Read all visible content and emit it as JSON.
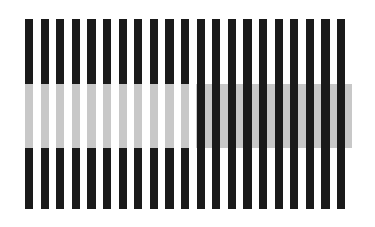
{
  "figure": {
    "canvas": {
      "width": 375,
      "height": 227,
      "background": "#ffffff"
    },
    "plate": {
      "x": 25,
      "y": 19,
      "width": 327,
      "height": 190
    },
    "colors": {
      "stripe_dark": "#1a1a1a",
      "stripe_light": "#ffffff",
      "band_gray": "#c8c8c8",
      "band_gray_left_label": "gray on dark stripes (appears lighter)",
      "band_gray_right_label": "gray on white gaps (appears darker)"
    },
    "grating": {
      "orientation": "vertical",
      "stripe_count": 21,
      "period": 15.6,
      "stripe_width": 8.2,
      "first_stripe_x": 25
    },
    "bands": [
      {
        "id": "left-band",
        "name": "left-gray-band",
        "side": "left",
        "x": 25,
        "y": 84,
        "width": 167,
        "height": 64,
        "replaces": "dark-stripes",
        "fill": "#c8c8c8"
      },
      {
        "id": "right-band",
        "name": "right-gray-band",
        "side": "right",
        "x": 196,
        "y": 84,
        "width": 156,
        "height": 64,
        "replaces": "white-gaps",
        "fill": "#c8c8c8"
      }
    ]
  }
}
